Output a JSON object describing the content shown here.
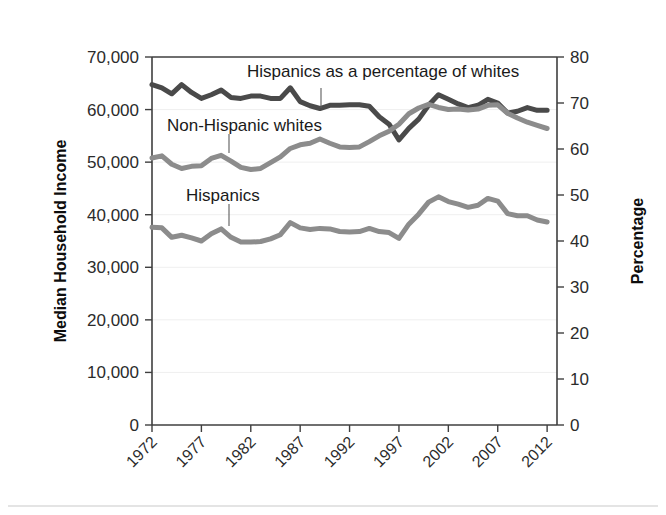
{
  "chart_data": {
    "type": "line",
    "title": "",
    "xlabel": "",
    "ylabel": "Median Household Income",
    "y2label": "Percentage",
    "xlim": [
      1972,
      2013
    ],
    "ylim": [
      0,
      70000
    ],
    "y2lim": [
      0,
      80
    ],
    "grid": true,
    "legend_position": "inline-annotations",
    "x_tick_labels": [
      "1972",
      "1977",
      "1982",
      "1987",
      "1992",
      "1997",
      "2002",
      "2007",
      "2012"
    ],
    "x_ticks": [
      1972,
      1977,
      1982,
      1987,
      1992,
      1997,
      2002,
      2007,
      2012
    ],
    "y_tick_labels": [
      "0",
      "10,000",
      "20,000",
      "30,000",
      "40,000",
      "50,000",
      "60,000",
      "70,000"
    ],
    "y_ticks": [
      0,
      10000,
      20000,
      30000,
      40000,
      50000,
      60000,
      70000
    ],
    "y2_tick_labels": [
      "0",
      "10",
      "20",
      "30",
      "40",
      "50",
      "60",
      "70",
      "80"
    ],
    "y2_ticks": [
      0,
      10,
      20,
      30,
      40,
      50,
      60,
      70,
      80
    ],
    "colors": {
      "ratio_line": "#4a4a4a",
      "whites_line": "#8c8c8c",
      "hispanics_line": "#8c8c8c",
      "axis": "#3f3f3f",
      "grid": "#efefef",
      "text": "#1a1a1a"
    },
    "x": [
      1972,
      1973,
      1974,
      1975,
      1976,
      1977,
      1978,
      1979,
      1980,
      1981,
      1982,
      1983,
      1984,
      1985,
      1986,
      1987,
      1988,
      1989,
      1990,
      1991,
      1992,
      1993,
      1994,
      1995,
      1996,
      1997,
      1998,
      1999,
      2000,
      2001,
      2002,
      2003,
      2004,
      2005,
      2006,
      2007,
      2008,
      2009,
      2010,
      2011,
      2012
    ],
    "series": [
      {
        "name": "Hispanics as a percentage of whites",
        "axis": "right",
        "unit": "percent",
        "color": "#4a4a4a",
        "label_text": "Hispanics as a percentage of whites",
        "values": [
          74.0,
          73.3,
          72.0,
          74.0,
          72.3,
          71.0,
          71.8,
          72.8,
          71.2,
          71.0,
          71.5,
          71.5,
          71.0,
          71.0,
          73.3,
          70.3,
          69.4,
          68.8,
          69.5,
          69.5,
          69.6,
          69.6,
          69.3,
          67.0,
          65.4,
          62.0,
          64.5,
          66.5,
          69.5,
          71.8,
          70.8,
          69.8,
          69.0,
          69.5,
          70.8,
          70.0,
          67.8,
          68.2,
          69.0,
          68.4,
          68.4
        ]
      },
      {
        "name": "Non-Hispanic whites",
        "axis": "left",
        "unit": "dollars",
        "color": "#8c8c8c",
        "label_text": "Non-Hispanic whites",
        "values": [
          50800,
          51200,
          49600,
          48800,
          49200,
          49300,
          50700,
          51300,
          50200,
          49000,
          48600,
          48800,
          49900,
          51000,
          52600,
          53300,
          53600,
          54400,
          53600,
          52900,
          52800,
          52900,
          53900,
          55000,
          55900,
          57200,
          59200,
          60300,
          61000,
          60400,
          60000,
          60100,
          59900,
          60100,
          60800,
          60900,
          59300,
          58400,
          57600,
          57000,
          56400
        ]
      },
      {
        "name": "Hispanics",
        "axis": "left",
        "unit": "dollars",
        "color": "#8c8c8c",
        "label_text": "Hispanics",
        "values": [
          37600,
          37500,
          35700,
          36100,
          35600,
          35000,
          36400,
          37300,
          35700,
          34800,
          34800,
          34900,
          35400,
          36200,
          38500,
          37500,
          37200,
          37400,
          37300,
          36800,
          36700,
          36800,
          37400,
          36800,
          36600,
          35500,
          38200,
          40100,
          42400,
          43400,
          42500,
          42000,
          41400,
          41800,
          43100,
          42600,
          40200,
          39800,
          39800,
          39000,
          38600
        ]
      }
    ],
    "annotations": [
      {
        "text": "Hispanics as a percentage of whites",
        "target_series": "Hispanics as a percentage of whites",
        "leader": true
      },
      {
        "text": "Non-Hispanic whites",
        "target_series": "Non-Hispanic whites",
        "leader": true
      },
      {
        "text": "Hispanics",
        "target_series": "Hispanics",
        "leader": true
      }
    ]
  }
}
